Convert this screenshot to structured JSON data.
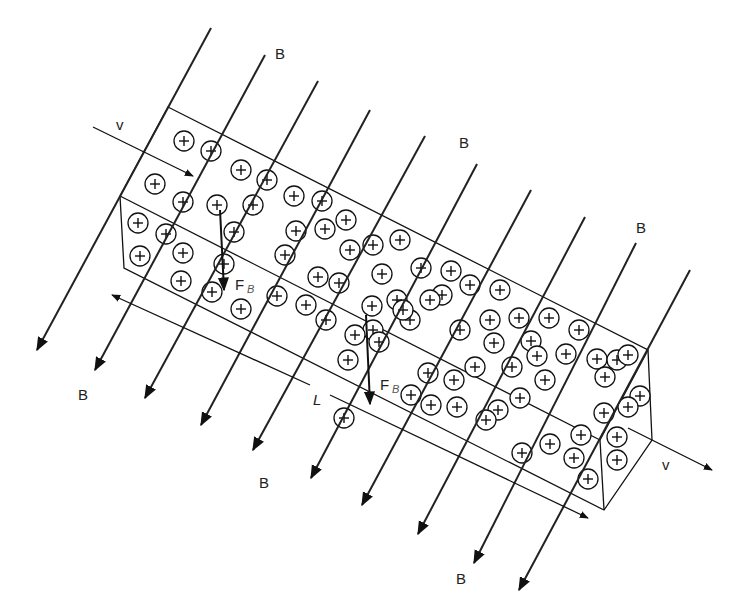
{
  "diagram": {
    "labels": {
      "field": "B",
      "velocity": "v",
      "force": "F",
      "force_sub": "B",
      "length": "L",
      "charge": "+"
    },
    "colors": {
      "line": "#111111",
      "field_line": "#222222",
      "background": "#ffffff"
    }
  }
}
